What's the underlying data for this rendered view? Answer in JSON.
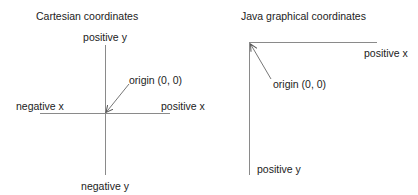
{
  "cartesian": {
    "title": "Cartesian coordinates",
    "positive_y": "positive y",
    "negative_y": "negative y",
    "positive_x": "positive x",
    "negative_x": "negative x",
    "origin": "origin (0, 0)"
  },
  "java": {
    "title": "Java graphical coordinates",
    "positive_x": "positive x",
    "positive_y": "positive y",
    "origin": "origin (0, 0)"
  },
  "colors": {
    "axis": "#8a8a8a",
    "text": "#222222"
  }
}
